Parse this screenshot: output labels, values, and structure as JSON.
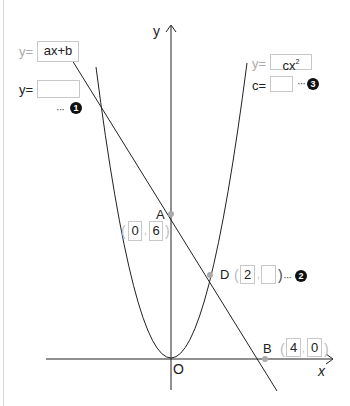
{
  "diagram": {
    "axes": {
      "y_label": "y",
      "x_label": "x",
      "origin_label": "O"
    },
    "line": {
      "prefix": "y=",
      "expression": "ax+b",
      "answer_prefix": "y=",
      "answer_value": "",
      "marker": "1"
    },
    "parabola": {
      "prefix": "y=",
      "expression_base": "cx",
      "expression_exp": "2",
      "answer_prefix": "c=",
      "answer_value": "",
      "marker": "3"
    },
    "points": {
      "A": {
        "label": "A",
        "x": "0",
        "y": "6"
      },
      "B": {
        "label": "B",
        "x": "4",
        "y": "0"
      },
      "D": {
        "label": "D",
        "x": "2",
        "y": "",
        "marker": "2"
      }
    },
    "dots": "···",
    "paren_open": "(",
    "paren_close": ")",
    "comma": ","
  }
}
